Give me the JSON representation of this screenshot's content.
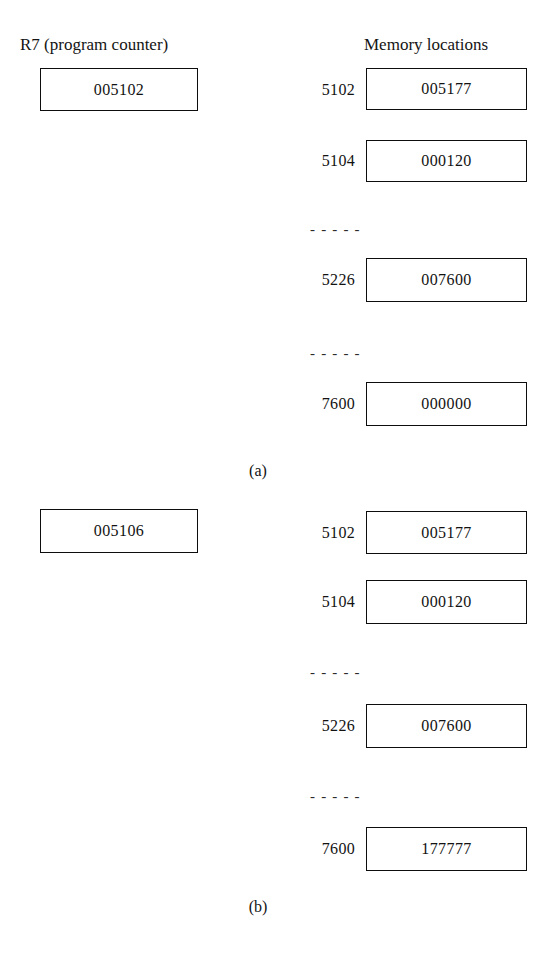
{
  "figure": {
    "headers": {
      "register": "R7 (program counter)",
      "memory": "Memory locations"
    },
    "separator_glyph": "- - - - -",
    "panels": [
      {
        "id": "a",
        "label": "(a)",
        "register": {
          "name": "R7",
          "value": "005102"
        },
        "memory": [
          {
            "address": "5102",
            "value": "005177"
          },
          {
            "address": "5104",
            "value": "000120"
          },
          {
            "separator": true
          },
          {
            "address": "5226",
            "value": "007600"
          },
          {
            "separator": true
          },
          {
            "address": "7600",
            "value": "000000"
          }
        ]
      },
      {
        "id": "b",
        "label": "(b)",
        "register": {
          "name": "R7",
          "value": "005106"
        },
        "memory": [
          {
            "address": "5102",
            "value": "005177"
          },
          {
            "address": "5104",
            "value": "000120"
          },
          {
            "separator": true
          },
          {
            "address": "5226",
            "value": "007600"
          },
          {
            "separator": true
          },
          {
            "address": "7600",
            "value": "177777"
          }
        ]
      }
    ]
  }
}
